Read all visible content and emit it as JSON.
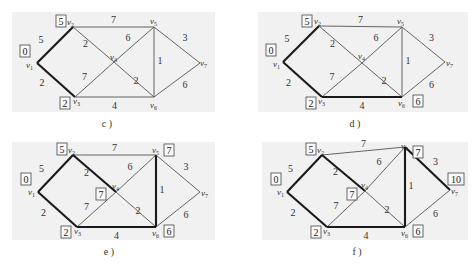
{
  "panels": [
    {
      "id": "c",
      "caption": "c )",
      "bg": [
        12,
        12,
        203,
        100
      ],
      "caption_pos": [
        107,
        127
      ],
      "nodes": {
        "v1": [
          37,
          63
        ],
        "v2": [
          73,
          27
        ],
        "v3": [
          75,
          97
        ],
        "v4": [
          114,
          62
        ],
        "v5": [
          154,
          27
        ],
        "v6": [
          154,
          97
        ],
        "v7": [
          200,
          63
        ]
      },
      "node_labels": {
        "v1": {
          "text": "v",
          "sub": "1",
          "pos": [
            26,
            68
          ]
        },
        "v2": {
          "text": "v",
          "sub": "2",
          "pos": [
            67,
            25
          ]
        },
        "v3": {
          "text": "v",
          "sub": "3",
          "pos": [
            73,
            104
          ]
        },
        "v4": {
          "text": "v",
          "sub": "4",
          "pos": [
            110,
            60
          ]
        },
        "v5": {
          "text": "v",
          "sub": "5",
          "pos": [
            150,
            24
          ]
        },
        "v6": {
          "text": "v",
          "sub": "6",
          "pos": [
            150,
            108
          ]
        },
        "v7": {
          "text": "v",
          "sub": "7",
          "pos": [
            200,
            66
          ]
        }
      },
      "boxes": [
        {
          "node": "v1",
          "value": "0",
          "pos": [
            20,
            45
          ]
        },
        {
          "node": "v2",
          "value": "5",
          "pos": [
            56,
            15
          ]
        },
        {
          "node": "v3",
          "value": "2",
          "pos": [
            60,
            97
          ]
        }
      ],
      "bold_edges": [
        "v1-v2",
        "v1-v3"
      ]
    },
    {
      "id": "d",
      "caption": "d )",
      "bg": [
        258,
        12,
        210,
        100
      ],
      "caption_pos": [
        355,
        127
      ],
      "nodes": {
        "v1": [
          283,
          62
        ],
        "v2": [
          319,
          26
        ],
        "v3": [
          322,
          97
        ],
        "v4": [
          362,
          63
        ],
        "v5": [
          402,
          27
        ],
        "v6": [
          402,
          97
        ],
        "v7": [
          445,
          62
        ]
      },
      "node_labels": {
        "v1": {
          "text": "v",
          "sub": "1",
          "pos": [
            273,
            67
          ]
        },
        "v2": {
          "text": "v",
          "sub": "2",
          "pos": [
            314,
            24
          ]
        },
        "v3": {
          "text": "v",
          "sub": "3",
          "pos": [
            318,
            104
          ]
        },
        "v4": {
          "text": "v",
          "sub": "4",
          "pos": [
            358,
            59
          ]
        },
        "v5": {
          "text": "v",
          "sub": "5",
          "pos": [
            397,
            24
          ]
        },
        "v6": {
          "text": "v",
          "sub": "6",
          "pos": [
            398,
            106
          ]
        },
        "v7": {
          "text": "v",
          "sub": "7",
          "pos": [
            446,
            66
          ]
        }
      },
      "boxes": [
        {
          "node": "v1",
          "value": "0",
          "pos": [
            266,
            44
          ]
        },
        {
          "node": "v2",
          "value": "5",
          "pos": [
            302,
            15
          ]
        },
        {
          "node": "v3",
          "value": "2",
          "pos": [
            306,
            97
          ]
        },
        {
          "node": "v6",
          "value": "6",
          "pos": [
            413,
            95
          ]
        }
      ],
      "bold_edges": [
        "v1-v2",
        "v1-v3",
        "v3-v6"
      ]
    },
    {
      "id": "e",
      "caption": "e )",
      "bg": [
        12,
        142,
        203,
        98
      ],
      "caption_pos": [
        109,
        255
      ],
      "nodes": {
        "v1": [
          38,
          192
        ],
        "v2": [
          73,
          155
        ],
        "v3": [
          77,
          227
        ],
        "v4": [
          116,
          192
        ],
        "v5": [
          156,
          155
        ],
        "v6": [
          156,
          227
        ],
        "v7": [
          200,
          192
        ]
      },
      "node_labels": {
        "v1": {
          "text": "v",
          "sub": "1",
          "pos": [
            28,
            195
          ]
        },
        "v2": {
          "text": "v",
          "sub": "2",
          "pos": [
            68,
            153
          ]
        },
        "v3": {
          "text": "v",
          "sub": "3",
          "pos": [
            74,
            234
          ]
        },
        "v4": {
          "text": "v",
          "sub": "4",
          "pos": [
            112,
            189
          ]
        },
        "v5": {
          "text": "v",
          "sub": "5",
          "pos": [
            152,
            153
          ]
        },
        "v6": {
          "text": "v",
          "sub": "6",
          "pos": [
            152,
            236
          ]
        },
        "v7": {
          "text": "v",
          "sub": "7",
          "pos": [
            201,
            196
          ]
        }
      },
      "boxes": [
        {
          "node": "v1",
          "value": "0",
          "pos": [
            21,
            173
          ]
        },
        {
          "node": "v2",
          "value": "5",
          "pos": [
            57,
            143
          ]
        },
        {
          "node": "v3",
          "value": "2",
          "pos": [
            61,
            226
          ]
        },
        {
          "node": "v4",
          "value": "7",
          "pos": [
            96,
            188
          ]
        },
        {
          "node": "v5",
          "value": "7",
          "pos": [
            164,
            144
          ]
        },
        {
          "node": "v6",
          "value": "6",
          "pos": [
            164,
            225
          ]
        }
      ],
      "bold_edges": [
        "v1-v2",
        "v1-v3",
        "v3-v6",
        "v2-v4",
        "v5-v6"
      ]
    },
    {
      "id": "f",
      "caption": "f )",
      "bg": [
        262,
        142,
        206,
        98
      ],
      "caption_pos": [
        357,
        255
      ],
      "nodes": {
        "v1": [
          287,
          192
        ],
        "v2": [
          322,
          155
        ],
        "v3": [
          327,
          227
        ],
        "v4": [
          365,
          191
        ],
        "v5": [
          405,
          147
        ],
        "v6": [
          405,
          227
        ],
        "v7": [
          450,
          190
        ]
      },
      "node_labels": {
        "v1": {
          "text": "v",
          "sub": "1",
          "pos": [
            277,
            195
          ]
        },
        "v2": {
          "text": "v",
          "sub": "2",
          "pos": [
            317,
            153
          ]
        },
        "v3": {
          "text": "v",
          "sub": "3",
          "pos": [
            323,
            234
          ]
        },
        "v4": {
          "text": "v",
          "sub": "4",
          "pos": [
            361,
            188
          ]
        },
        "v5": {
          "text": "v",
          "sub": "5",
          "pos": [
            401,
            149
          ]
        },
        "v6": {
          "text": "v",
          "sub": "6",
          "pos": [
            401,
            236
          ]
        },
        "v7": {
          "text": "v",
          "sub": "7",
          "pos": [
            451,
            194
          ]
        }
      },
      "boxes": [
        {
          "node": "v1",
          "value": "0",
          "pos": [
            271,
            173
          ]
        },
        {
          "node": "v2",
          "value": "5",
          "pos": [
            306,
            143
          ]
        },
        {
          "node": "v3",
          "value": "2",
          "pos": [
            311,
            226
          ]
        },
        {
          "node": "v4",
          "value": "7",
          "pos": [
            347,
            188
          ]
        },
        {
          "node": "v5",
          "value": "7",
          "pos": [
            413,
            146
          ]
        },
        {
          "node": "v6",
          "value": "6",
          "pos": [
            413,
            225
          ]
        },
        {
          "node": "v7",
          "value": "10",
          "pos": [
            448,
            173
          ]
        }
      ],
      "bold_edges": [
        "v1-v2",
        "v1-v3",
        "v3-v6",
        "v2-v4",
        "v5-v6",
        "v5-v7"
      ]
    }
  ],
  "edges": [
    {
      "id": "v1-v2",
      "from": "v1",
      "to": "v2",
      "weight": "5",
      "label_offset": [
        -14,
        -2
      ]
    },
    {
      "id": "v1-v3",
      "from": "v1",
      "to": "v3",
      "weight": "2",
      "label_offset": [
        -14,
        6
      ]
    },
    {
      "id": "v2-v5",
      "from": "v2",
      "to": "v5",
      "weight": "7",
      "label_offset": [
        0,
        -4
      ]
    },
    {
      "id": "v2-v4",
      "from": "v2",
      "to": "v4",
      "weight": "2",
      "label_offset": [
        -8,
        2
      ]
    },
    {
      "id": "v4-v6",
      "from": "v4",
      "to": "v6",
      "weight": "2",
      "label_offset": [
        2,
        4
      ]
    },
    {
      "id": "v3-v4",
      "from": "v3",
      "to": "v4",
      "weight": "7",
      "label_offset": [
        -10,
        0
      ]
    },
    {
      "id": "v4-v5",
      "from": "v4",
      "to": "v5",
      "weight": "6",
      "label_offset": [
        -6,
        -4
      ]
    },
    {
      "id": "v3-v6",
      "from": "v3",
      "to": "v6",
      "weight": "4",
      "label_offset": [
        0,
        12
      ]
    },
    {
      "id": "v5-v6",
      "from": "v5",
      "to": "v6",
      "weight": "1",
      "label_offset": [
        6,
        2
      ]
    },
    {
      "id": "v5-v7",
      "from": "v5",
      "to": "v7",
      "weight": "3",
      "label_offset": [
        8,
        -4
      ]
    },
    {
      "id": "v6-v7",
      "from": "v6",
      "to": "v7",
      "weight": "6",
      "label_offset": [
        8,
        8
      ]
    }
  ],
  "colors": {
    "background": "#ffffff",
    "panel_bg": "#f1f1f1",
    "edge": "#555555",
    "bold_edge": "#1a1a1a"
  }
}
